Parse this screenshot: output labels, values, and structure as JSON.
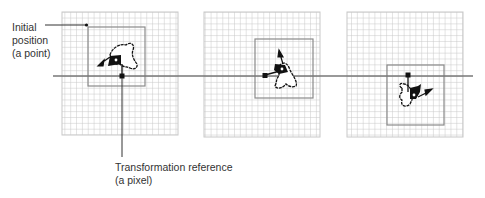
{
  "labels": {
    "initial_position": {
      "lines": [
        "Initial",
        "position",
        "(a point)"
      ]
    },
    "transformation_reference": {
      "lines": [
        "Transformation reference",
        "(a pixel)"
      ]
    }
  },
  "colors": {
    "grid_line": "#c8c8c8",
    "box_border": "#8a8a8a",
    "axis_line": "#777777",
    "shape_stroke": "#111111",
    "shape_fill": "#ffffff",
    "marker": "#111111",
    "text": "#333333"
  },
  "grid": {
    "cell_size": 5.85,
    "cols": 20,
    "rows": 21
  },
  "panels": [
    {
      "name": "panel-1",
      "grid": {
        "x": 62,
        "y": 12,
        "w": 116,
        "h": 123
      },
      "box": {
        "x": 88,
        "y": 27,
        "w": 57,
        "h": 59
      },
      "ref_marker": {
        "x": 122,
        "y": 76
      },
      "center": {
        "x": 117,
        "y": 60
      }
    },
    {
      "name": "panel-2",
      "grid": {
        "x": 204,
        "y": 12,
        "w": 116,
        "h": 125
      },
      "box": {
        "x": 255,
        "y": 39,
        "w": 58,
        "h": 59
      },
      "ref_marker": {
        "x": 265,
        "y": 75
      },
      "center": {
        "x": 283,
        "y": 69
      }
    },
    {
      "name": "panel-3",
      "grid": {
        "x": 347,
        "y": 12,
        "w": 116,
        "h": 125
      },
      "box": {
        "x": 387,
        "y": 65,
        "w": 57,
        "h": 60
      },
      "ref_marker": {
        "x": 408,
        "y": 75
      },
      "center": {
        "x": 414,
        "y": 95
      }
    }
  ],
  "axis": {
    "x1": 53,
    "x2": 473,
    "y": 76
  }
}
